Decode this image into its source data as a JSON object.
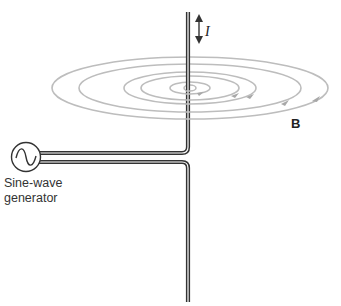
{
  "diagram": {
    "labels": {
      "current": "I",
      "field": "B",
      "generator_line1": "Sine-wave",
      "generator_line2": "generator"
    },
    "components": [
      "sine-wave generator",
      "straight vertical wire",
      "concentric magnetic field loops",
      "current direction arrow (bidirectional)"
    ],
    "colors": {
      "wire": "#333333",
      "field_lines": "#b8b8b8",
      "text": "#222222"
    }
  }
}
